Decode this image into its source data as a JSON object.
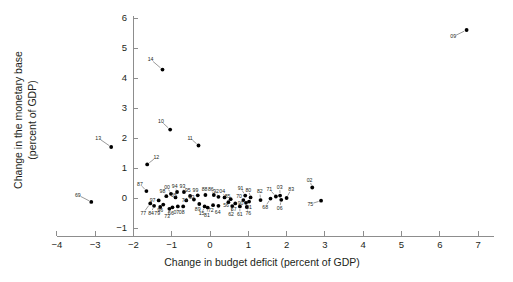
{
  "chart_data": {
    "type": "scatter",
    "title": "",
    "subtitle": "",
    "xlabel": "Change in budget deficit (percent of GDP)",
    "ylabel": "Change in the monetary base\n(percent of GDP)",
    "ylabel_line1": "Change in the monetary base",
    "ylabel_line2": "(percent of GDP)",
    "xlim": [
      -4,
      7
    ],
    "ylim": [
      -1,
      6
    ],
    "xticks": [
      -4,
      -3,
      -2,
      -1,
      0,
      1,
      2,
      3,
      4,
      5,
      6,
      7
    ],
    "xticklabels": [
      "−4",
      "−3",
      "−2",
      "−1",
      "0",
      "1",
      "2",
      "3",
      "4",
      "5",
      "6",
      "7"
    ],
    "yticks": [
      -1,
      0,
      1,
      2,
      3,
      4,
      5,
      6
    ],
    "yticklabels": [
      "−1",
      "0",
      "1",
      "2",
      "3",
      "4",
      "5",
      "6"
    ],
    "grid": false,
    "legend": null,
    "marker": "filled-circle",
    "marker_color": "#000000",
    "point_label_kind": "two-digit-year",
    "points": [
      {
        "label": "09",
        "x": 6.7,
        "y": 5.6,
        "lx": 6.35,
        "ly": 5.38
      },
      {
        "label": "14",
        "x": -1.24,
        "y": 4.28,
        "lx": -1.55,
        "ly": 4.62
      },
      {
        "label": "10",
        "x": -1.04,
        "y": 2.28,
        "lx": -1.28,
        "ly": 2.56
      },
      {
        "label": "11",
        "x": -0.3,
        "y": 1.75,
        "lx": -0.52,
        "ly": 2.0
      },
      {
        "label": "13",
        "x": -2.58,
        "y": 1.7,
        "lx": -2.92,
        "ly": 2.0
      },
      {
        "label": "12",
        "x": -1.64,
        "y": 1.12,
        "lx": -1.4,
        "ly": 1.36
      },
      {
        "label": "87",
        "x": -1.66,
        "y": 0.23,
        "lx": -1.83,
        "ly": 0.47
      },
      {
        "label": "69",
        "x": -3.1,
        "y": -0.13,
        "lx": -3.45,
        "ly": 0.1
      },
      {
        "label": "02",
        "x": 2.67,
        "y": 0.35,
        "lx": 2.6,
        "ly": 0.6
      },
      {
        "label": "75",
        "x": 2.9,
        "y": -0.09,
        "lx": 2.62,
        "ly": -0.2
      },
      {
        "label": "83",
        "x": 2.0,
        "y": 0.0,
        "lx": 2.12,
        "ly": 0.3
      },
      {
        "label": "03",
        "x": 1.83,
        "y": 0.08,
        "lx": 1.82,
        "ly": 0.37
      },
      {
        "label": "71",
        "x": 1.72,
        "y": 0.05,
        "lx": 1.55,
        "ly": 0.3
      },
      {
        "label": "06",
        "x": 1.86,
        "y": -0.06,
        "lx": 1.82,
        "ly": -0.34
      },
      {
        "label": "68",
        "x": 1.58,
        "y": -0.02,
        "lx": 1.44,
        "ly": -0.3
      },
      {
        "label": "82",
        "x": 1.32,
        "y": -0.07,
        "lx": 1.3,
        "ly": 0.22
      },
      {
        "label": "80",
        "x": 1.06,
        "y": 0.02,
        "lx": 1.0,
        "ly": 0.27
      },
      {
        "label": "91",
        "x": 0.92,
        "y": 0.08,
        "lx": 0.8,
        "ly": 0.34
      },
      {
        "label": "70",
        "x": 0.87,
        "y": -0.07,
        "lx": 0.76,
        "ly": 0.05
      },
      {
        "label": "90",
        "x": 0.94,
        "y": -0.16,
        "lx": 0.8,
        "ly": -0.16
      },
      {
        "label": "01",
        "x": 1.02,
        "y": -0.12,
        "lx": 1.02,
        "ly": -0.31
      },
      {
        "label": "76",
        "x": 0.96,
        "y": -0.3,
        "lx": 1.0,
        "ly": -0.52
      },
      {
        "label": "61",
        "x": 0.78,
        "y": -0.28,
        "lx": 0.78,
        "ly": -0.55
      },
      {
        "label": "62",
        "x": 0.58,
        "y": -0.27,
        "lx": 0.55,
        "ly": -0.55
      },
      {
        "label": "67",
        "x": 0.66,
        "y": -0.18,
        "lx": 0.62,
        "ly": -0.38
      },
      {
        "label": "85",
        "x": 0.54,
        "y": -0.04,
        "lx": 0.46,
        "ly": 0.07
      },
      {
        "label": "56",
        "x": 0.48,
        "y": -0.14,
        "lx": 0.42,
        "ly": -0.24
      },
      {
        "label": "04",
        "x": 0.38,
        "y": 0.02,
        "lx": 0.32,
        "ly": 0.22
      },
      {
        "label": "92",
        "x": 0.22,
        "y": 0.04,
        "lx": 0.16,
        "ly": 0.24
      },
      {
        "label": "86",
        "x": 0.1,
        "y": 0.1,
        "lx": 0.02,
        "ly": 0.31
      },
      {
        "label": "64",
        "x": 0.22,
        "y": -0.26,
        "lx": 0.2,
        "ly": -0.46
      },
      {
        "label": "72",
        "x": 0.08,
        "y": -0.24,
        "lx": 0.02,
        "ly": -0.42
      },
      {
        "label": "81",
        "x": -0.06,
        "y": -0.32,
        "lx": -0.08,
        "ly": -0.56
      },
      {
        "label": "15",
        "x": -0.14,
        "y": -0.28,
        "lx": -0.22,
        "ly": -0.52
      },
      {
        "label": "88",
        "x": -0.12,
        "y": 0.1,
        "lx": -0.14,
        "ly": 0.3
      },
      {
        "label": "99",
        "x": -0.32,
        "y": 0.09,
        "lx": -0.38,
        "ly": 0.27
      },
      {
        "label": "89",
        "x": -0.28,
        "y": -0.2,
        "lx": -0.32,
        "ly": -0.38
      },
      {
        "label": "95",
        "x": -0.52,
        "y": 0.07,
        "lx": -0.58,
        "ly": 0.25
      },
      {
        "label": "63",
        "x": -0.42,
        "y": -0.05,
        "lx": -0.48,
        "ly": 0.03
      },
      {
        "label": "93",
        "x": -0.68,
        "y": 0.2,
        "lx": -0.72,
        "ly": 0.4
      },
      {
        "label": "74",
        "x": -0.62,
        "y": -0.08,
        "lx": -0.66,
        "ly": -0.08
      },
      {
        "label": "94",
        "x": -0.86,
        "y": 0.2,
        "lx": -0.92,
        "ly": 0.41
      },
      {
        "label": "08",
        "x": -0.7,
        "y": -0.28,
        "lx": -0.74,
        "ly": -0.48
      },
      {
        "label": "07",
        "x": -0.84,
        "y": -0.28,
        "lx": -0.88,
        "ly": -0.48
      },
      {
        "label": "05",
        "x": -0.9,
        "y": 0.02,
        "lx": -0.94,
        "ly": 0.1
      },
      {
        "label": "00",
        "x": -1.02,
        "y": 0.14,
        "lx": -1.12,
        "ly": 0.37
      },
      {
        "label": "98",
        "x": -1.14,
        "y": 0.06,
        "lx": -1.24,
        "ly": 0.22
      },
      {
        "label": "66",
        "x": -0.98,
        "y": -0.31,
        "lx": -1.02,
        "ly": -0.5
      },
      {
        "label": "73",
        "x": -1.06,
        "y": -0.36,
        "lx": -1.12,
        "ly": -0.6
      },
      {
        "label": "96",
        "x": -1.22,
        "y": -0.22,
        "lx": -1.3,
        "ly": -0.4
      },
      {
        "label": "79",
        "x": -1.3,
        "y": -0.3,
        "lx": -1.38,
        "ly": -0.5
      },
      {
        "label": "97",
        "x": -1.34,
        "y": -0.08,
        "lx": -1.5,
        "ly": -0.06
      },
      {
        "label": "84",
        "x": -1.46,
        "y": -0.26,
        "lx": -1.54,
        "ly": -0.5
      },
      {
        "label": "77",
        "x": -1.56,
        "y": -0.18,
        "lx": -1.74,
        "ly": -0.5
      }
    ]
  },
  "axes": {
    "x_title": "Change in budget deficit (percent of GDP)",
    "y_title_line1": "Change in the monetary base",
    "y_title_line2": "(percent of GDP)"
  }
}
